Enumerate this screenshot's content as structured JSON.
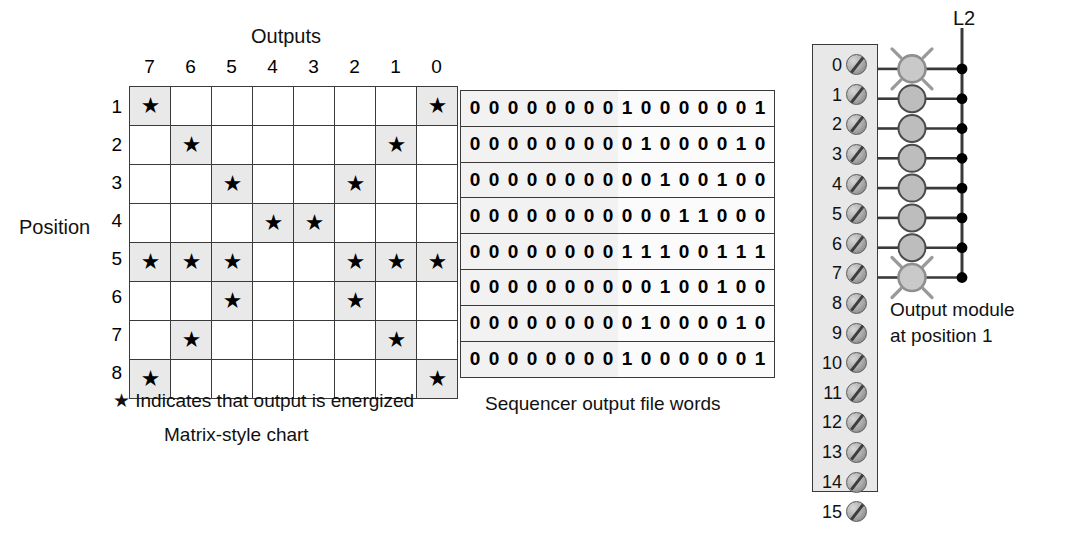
{
  "diagram": {
    "matrix": {
      "title": "Outputs",
      "row_axis_label": "Position",
      "column_headers": [
        "7",
        "6",
        "5",
        "4",
        "3",
        "2",
        "1",
        "0"
      ],
      "row_headers": [
        "1",
        "2",
        "3",
        "4",
        "5",
        "6",
        "7",
        "8"
      ],
      "star_glyph": "★",
      "legend": "★ Indicates that output is energized",
      "caption": "Matrix-style chart",
      "cells": [
        [
          1,
          0,
          0,
          0,
          0,
          0,
          0,
          1
        ],
        [
          0,
          1,
          0,
          0,
          0,
          0,
          1,
          0
        ],
        [
          0,
          0,
          1,
          0,
          0,
          1,
          0,
          0
        ],
        [
          0,
          0,
          0,
          1,
          1,
          0,
          0,
          0
        ],
        [
          1,
          1,
          1,
          0,
          0,
          1,
          1,
          1
        ],
        [
          0,
          0,
          1,
          0,
          0,
          1,
          0,
          0
        ],
        [
          0,
          1,
          0,
          0,
          0,
          0,
          1,
          0
        ],
        [
          1,
          0,
          0,
          0,
          0,
          0,
          0,
          1
        ]
      ]
    },
    "sequencer": {
      "caption": "Sequencer output file words",
      "words": [
        "0000000010000001",
        "0000000001000010",
        "0000000000100100",
        "0000000000011000",
        "0000000011100111",
        "0000000000100100",
        "0000000001000010",
        "0000000010000001"
      ]
    },
    "module": {
      "caption_line1": "Output module",
      "caption_line2": "at position 1",
      "rail_label": "L2",
      "terminals": [
        {
          "number": "0",
          "wired": true,
          "lamp_on": true
        },
        {
          "number": "1",
          "wired": true,
          "lamp_on": false
        },
        {
          "number": "2",
          "wired": true,
          "lamp_on": false
        },
        {
          "number": "3",
          "wired": true,
          "lamp_on": false
        },
        {
          "number": "4",
          "wired": true,
          "lamp_on": false
        },
        {
          "number": "5",
          "wired": true,
          "lamp_on": false
        },
        {
          "number": "6",
          "wired": true,
          "lamp_on": false
        },
        {
          "number": "7",
          "wired": true,
          "lamp_on": true
        },
        {
          "number": "8",
          "wired": false,
          "lamp_on": false
        },
        {
          "number": "9",
          "wired": false,
          "lamp_on": false
        },
        {
          "number": "10",
          "wired": false,
          "lamp_on": false
        },
        {
          "number": "11",
          "wired": false,
          "lamp_on": false
        },
        {
          "number": "12",
          "wired": false,
          "lamp_on": false
        },
        {
          "number": "13",
          "wired": false,
          "lamp_on": false
        },
        {
          "number": "14",
          "wired": false,
          "lamp_on": false
        },
        {
          "number": "15",
          "wired": false,
          "lamp_on": false
        }
      ]
    },
    "colors": {
      "cell_shaded": "#e9e9e9",
      "module_fill": "#e8e8e8",
      "lamp_fill": "#bdbdbd",
      "line": "#3a3a3a",
      "seq_fill": "#f2f2f2"
    }
  }
}
